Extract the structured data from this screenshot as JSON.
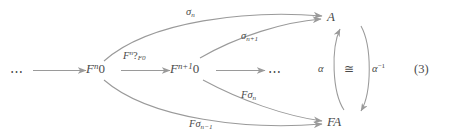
{
  "figure": {
    "kind": "commutative-diagram",
    "equation_number": "(3)",
    "stroke_color": "#9a9a9a",
    "text_color": "#4a4a4a",
    "background_color": "#ffffff"
  },
  "nodes": {
    "left_dots": "⋯",
    "fn0": {
      "base": "F",
      "exp": "n",
      "obj": "0"
    },
    "fn10": {
      "base": "F",
      "exp": "n+1",
      "obj": "0"
    },
    "right_dots": "⋯",
    "a": "A",
    "fa": "FA"
  },
  "edges": {
    "chain_first": {
      "label": "",
      "from": "⋯",
      "to": "F^n 0"
    },
    "chain_second": {
      "label_main": "F",
      "label_exp": "n",
      "label_mark": "?",
      "label_sub": "F0",
      "from": "F^n 0",
      "to": "F^{n+1} 0"
    },
    "chain_third": {
      "label": "",
      "from": "F^{n+1} 0",
      "to": "⋯"
    },
    "sigma_n": {
      "sym": "σ",
      "sub": "n",
      "from": "F^n 0",
      "to": "A"
    },
    "sigma_n1": {
      "sym": "σ",
      "sub": "n+1",
      "from": "F^{n+1} 0",
      "to": "A"
    },
    "f_sigma_n": {
      "prefix": "F",
      "sym": "σ",
      "sub": "n",
      "from": "F^{n+1} 0",
      "to": "FA"
    },
    "f_sigma_n1": {
      "prefix": "F",
      "sym": "σ",
      "sub": "n−1",
      "from": "F^n 0",
      "to": "FA"
    },
    "alpha": {
      "label": "α",
      "from": "FA",
      "to": "A"
    },
    "alpha_inv": {
      "sym": "α",
      "exp": "−1",
      "from": "A",
      "to": "FA"
    },
    "iso": {
      "label": "≅"
    }
  }
}
